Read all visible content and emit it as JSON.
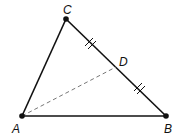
{
  "diagram": {
    "type": "triangle-median",
    "points": {
      "A": {
        "label": "A",
        "x": 22,
        "y": 116
      },
      "B": {
        "label": "B",
        "x": 166,
        "y": 116
      },
      "C": {
        "label": "C",
        "x": 66,
        "y": 19
      },
      "D": {
        "label": "D",
        "x": 116,
        "y": 67
      }
    },
    "segments": [
      {
        "from": "A",
        "to": "B",
        "style": "solid"
      },
      {
        "from": "A",
        "to": "C",
        "style": "solid"
      },
      {
        "from": "C",
        "to": "B",
        "style": "solid"
      },
      {
        "from": "A",
        "to": "D",
        "style": "dashed"
      }
    ],
    "congruence_marks": [
      {
        "segment": "CD",
        "ticks": 2
      },
      {
        "segment": "DB",
        "ticks": 2
      }
    ],
    "colors": {
      "stroke": "#111111",
      "dashed": "#777777"
    }
  }
}
